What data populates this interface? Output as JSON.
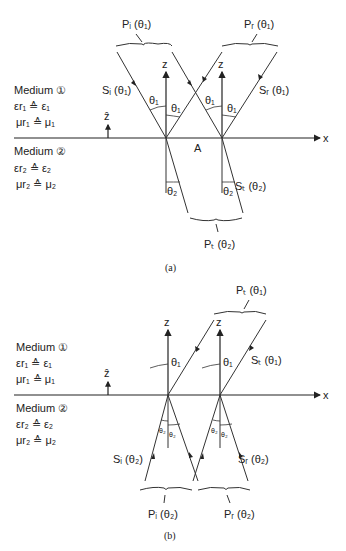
{
  "figure_a": {
    "caption": "(a)",
    "medium1": {
      "title": "Medium",
      "num": "①",
      "eps": "εr₁ ≙ ε₁",
      "mu": "μr₁ ≙ μ₁"
    },
    "medium2": {
      "title": "Medium",
      "num": "②",
      "eps": "εr₂ ≙ ε₂",
      "mu": "μr₂ ≙ μ₂"
    },
    "zhat": "ẑ",
    "x_axis": "x",
    "z_axis": "z",
    "point_A": "A",
    "theta1": "θ₁",
    "theta2": "θ₂",
    "Pi": "Pᵢ (θ₁)",
    "Pr": "Pᵣ (θ₁)",
    "Si": "Sᵢ (θ₁)",
    "Sr": "Sᵣ (θ₁)",
    "St": "Sₜ (θ₂)",
    "Pt": "Pₜ (θ₂)"
  },
  "figure_b": {
    "caption": "(b)",
    "medium1": {
      "title": "Medium",
      "num": "①",
      "eps": "εr₁ ≙ ε₁",
      "mu": "μr₁ ≙ μ₁"
    },
    "medium2": {
      "title": "Medium",
      "num": "②",
      "eps": "εr₂ ≙ ε₂",
      "mu": "μr₂ ≙ μ₂"
    },
    "zhat": "ẑ",
    "x_axis": "x",
    "z_axis": "z",
    "theta1": "θ₁",
    "theta2": "θ₂",
    "Pt": "Pₜ (θ₁)",
    "St": "Sₜ (θ₁)",
    "Si": "Sᵢ (θ₂)",
    "Sr": "Sᵣ (θ₂)",
    "Pi": "Pᵢ (θ₂)",
    "Pr": "Pᵣ (θ₂)"
  }
}
